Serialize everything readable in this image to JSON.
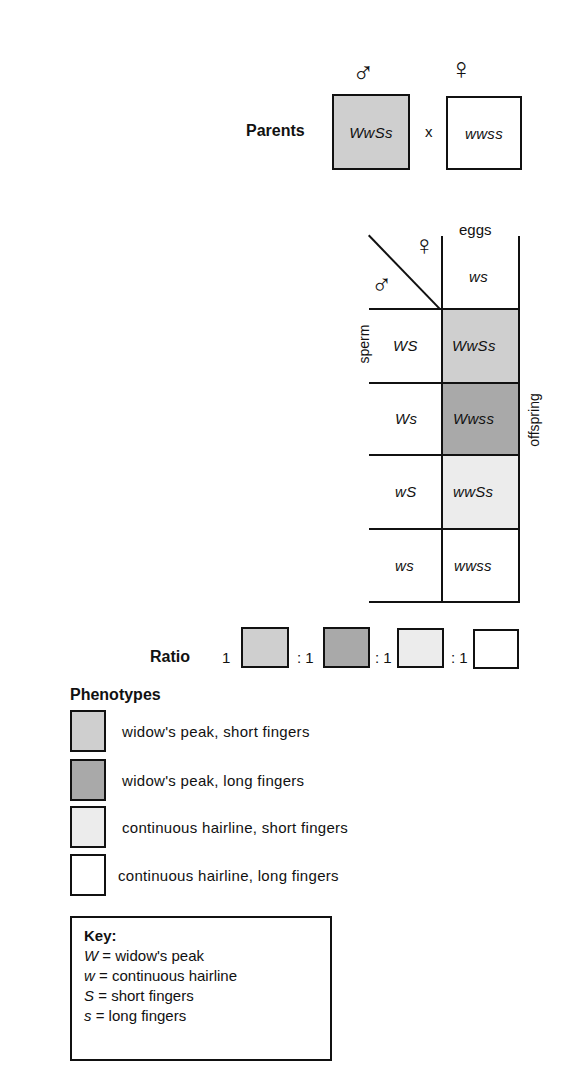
{
  "colors": {
    "widow_short": "#cfcfcf",
    "widow_long": "#a9a9a9",
    "hairline_short": "#ececec",
    "hairline_long": "#ffffff",
    "line": "#111111"
  },
  "parents": {
    "label": "Parents",
    "male_symbol": "♂",
    "female_symbol": "♀",
    "male_genotype": "WwSs",
    "cross": "x",
    "female_genotype": "wwss"
  },
  "punnett": {
    "corner_female_symbol": "♀",
    "corner_male_symbol": "♂",
    "column_header": "eggs",
    "egg_gametes": [
      "ws"
    ],
    "row_header": "sperm",
    "offspring_label": "offspring",
    "rows": [
      {
        "sperm": "WS",
        "offspring": "WwSs",
        "phenotype": "widow_short"
      },
      {
        "sperm": "Ws",
        "offspring": "Wwss",
        "phenotype": "widow_long"
      },
      {
        "sperm": "wS",
        "offspring": "wwSs",
        "phenotype": "hairline_short"
      },
      {
        "sperm": "ws",
        "offspring": "wwss",
        "phenotype": "hairline_long"
      }
    ]
  },
  "ratio": {
    "label": "Ratio",
    "values": [
      "1",
      ": 1",
      ": 1",
      ": 1"
    ]
  },
  "phenotypes": {
    "title": "Phenotypes",
    "items": [
      {
        "label": "widow's peak, short fingers"
      },
      {
        "label": "widow's peak, long fingers"
      },
      {
        "label": "continuous hairline, short fingers"
      },
      {
        "label": "continuous hairline, long fingers"
      }
    ]
  },
  "key": {
    "title": "Key:",
    "entries": [
      {
        "symbol": "W",
        "eq": " = ",
        "meaning": "widow's peak"
      },
      {
        "symbol": "w",
        "eq": " = ",
        "meaning": "continuous hairline"
      },
      {
        "symbol": "S",
        "eq": " = ",
        "meaning": "short fingers"
      },
      {
        "symbol": "s",
        "eq": " = ",
        "meaning": "long fingers"
      }
    ]
  }
}
